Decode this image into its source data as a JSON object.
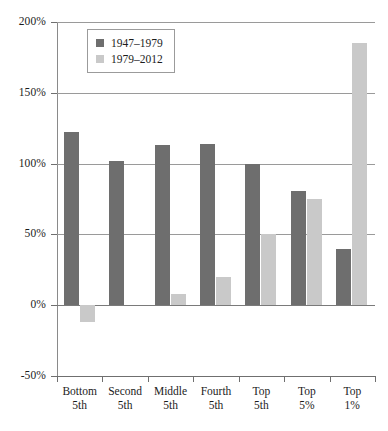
{
  "chart_data": {
    "type": "bar",
    "title": "",
    "subtitle": "",
    "xlabel": "",
    "ylabel": "",
    "ylim": [
      -50,
      200
    ],
    "ytick_labels": [
      "200%",
      "150%",
      "100%",
      "50%",
      "0%",
      "-50%"
    ],
    "ytick_values": [
      200,
      150,
      100,
      50,
      0,
      -50
    ],
    "grid": true,
    "legend_position": "upper-left-inside",
    "categories": [
      "Bottom 5th",
      "Second 5th",
      "Middle 5th",
      "Fourth 5th",
      "Top 5th",
      "Top 5%",
      "Top 1%"
    ],
    "category_lines": [
      [
        "Bottom",
        "5th"
      ],
      [
        "Second",
        "5th"
      ],
      [
        "Middle",
        "5th"
      ],
      [
        "Fourth",
        "5th"
      ],
      [
        "Top",
        "5th"
      ],
      [
        "Top",
        "5%"
      ],
      [
        "Top",
        "1%"
      ]
    ],
    "series": [
      {
        "name": "1947–1979",
        "color": "#6e6e6e",
        "values": [
          122,
          102,
          113,
          114,
          100,
          81,
          40
        ]
      },
      {
        "name": "1979–2012",
        "color": "#c9c9c9",
        "values": [
          -12,
          0,
          8,
          20,
          50,
          75,
          185
        ]
      }
    ]
  },
  "legend": {
    "items": [
      {
        "label": "1947–1979",
        "color": "#6e6e6e"
      },
      {
        "label": "1979–2012",
        "color": "#c9c9c9"
      }
    ]
  }
}
